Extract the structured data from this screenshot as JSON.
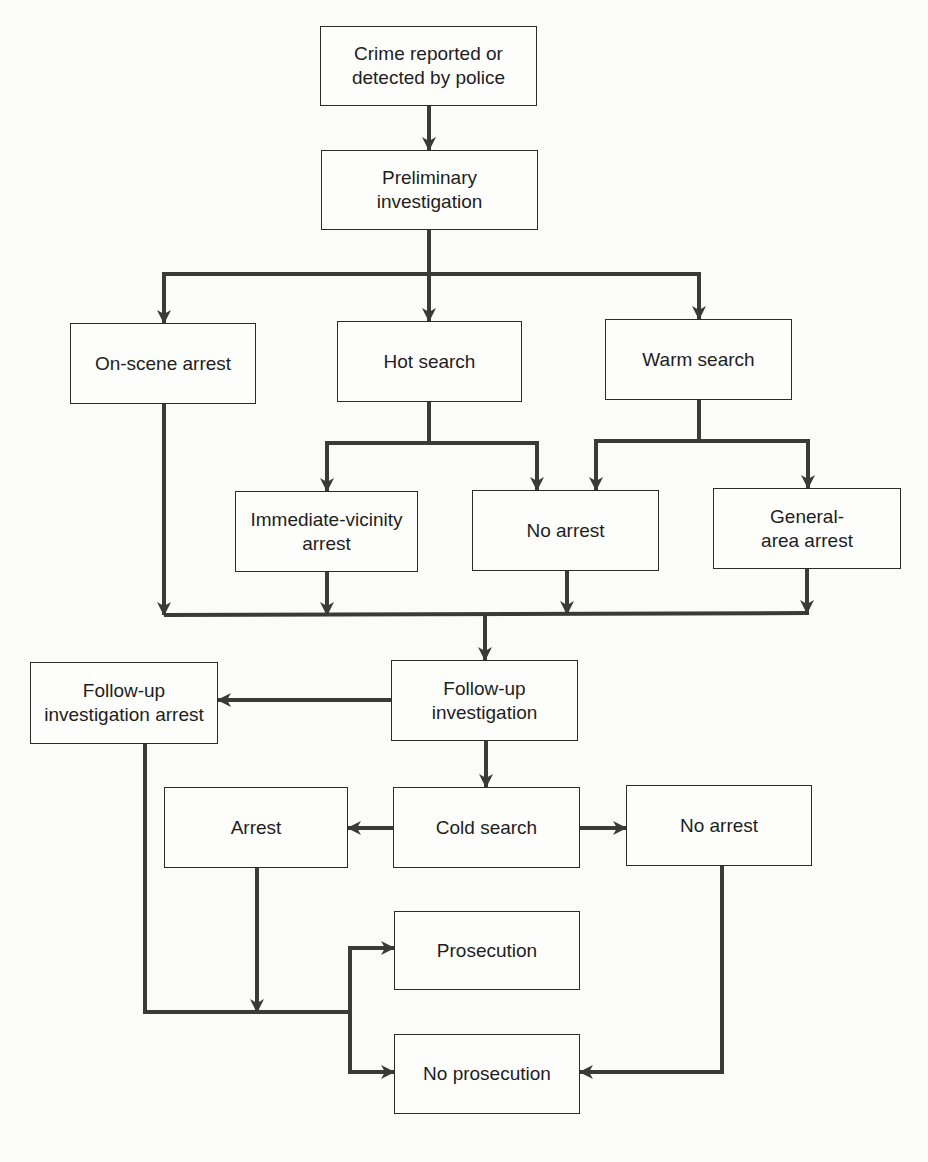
{
  "diagram": {
    "type": "flowchart",
    "colors": {
      "line": "#3a3a3a",
      "box_border": "#2b2b2b",
      "background": "#fbfbf9",
      "text": "#1e1e1e"
    },
    "nodes": {
      "crime_reported": "Crime reported or\ndetected by police",
      "preliminary_investigation": "Preliminary\ninvestigation",
      "on_scene_arrest": "On-scene arrest",
      "hot_search": "Hot search",
      "warm_search": "Warm search",
      "immediate_vicinity_arrest": "Immediate-vicinity\narrest",
      "no_arrest_1": "No arrest",
      "general_area_arrest": "General-\narea arrest",
      "followup_investigation": "Follow-up\ninvestigation",
      "followup_investigation_arrest": "Follow-up\ninvestigation arrest",
      "cold_search": "Cold search",
      "arrest": "Arrest",
      "no_arrest_2": "No arrest",
      "prosecution": "Prosecution",
      "no_prosecution": "No prosecution"
    },
    "edges": [
      [
        "crime_reported",
        "preliminary_investigation"
      ],
      [
        "preliminary_investigation",
        "on_scene_arrest"
      ],
      [
        "preliminary_investigation",
        "hot_search"
      ],
      [
        "preliminary_investigation",
        "warm_search"
      ],
      [
        "hot_search",
        "immediate_vicinity_arrest"
      ],
      [
        "hot_search",
        "no_arrest_1"
      ],
      [
        "warm_search",
        "no_arrest_1"
      ],
      [
        "warm_search",
        "general_area_arrest"
      ],
      [
        "on_scene_arrest",
        "followup_investigation"
      ],
      [
        "immediate_vicinity_arrest",
        "followup_investigation"
      ],
      [
        "no_arrest_1",
        "followup_investigation"
      ],
      [
        "general_area_arrest",
        "followup_investigation"
      ],
      [
        "followup_investigation",
        "followup_investigation_arrest"
      ],
      [
        "followup_investigation",
        "cold_search"
      ],
      [
        "cold_search",
        "arrest"
      ],
      [
        "cold_search",
        "no_arrest_2"
      ],
      [
        "followup_investigation_arrest",
        "prosecution"
      ],
      [
        "followup_investigation_arrest",
        "no_prosecution"
      ],
      [
        "arrest",
        "prosecution"
      ],
      [
        "arrest",
        "no_prosecution"
      ],
      [
        "no_arrest_2",
        "no_prosecution"
      ]
    ]
  }
}
